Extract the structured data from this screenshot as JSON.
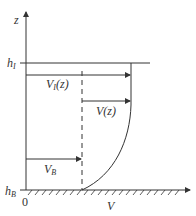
{
  "diagram": {
    "axis_z_label": "z",
    "axis_v_label": "V",
    "origin_label": "0",
    "h_I": {
      "base": "h",
      "sub": "I"
    },
    "h_B": {
      "base": "h",
      "sub": "B"
    },
    "V_I": {
      "base": "V",
      "sub": "I",
      "arg": "(z)"
    },
    "V_z": {
      "base": "V",
      "arg": "(z)"
    },
    "V_B": {
      "base": "V",
      "sub": "B"
    },
    "line_color": "#333333"
  }
}
